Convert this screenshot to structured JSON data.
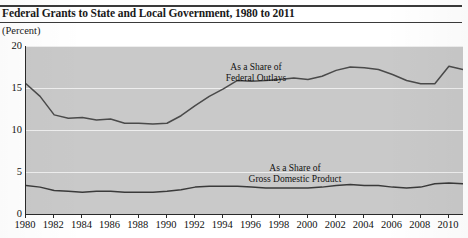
{
  "chart_data": {
    "type": "line",
    "title": "Federal Grants to State and Local Government, 1980 to 2011",
    "subtitle": "",
    "unit_label": "(Percent)",
    "xlabel": "",
    "ylabel": "",
    "grid": true,
    "legend_position": "inline-annotation",
    "xlim": [
      1980,
      2011
    ],
    "ylim": [
      0,
      20
    ],
    "yticks": [
      0,
      5,
      10,
      15,
      20
    ],
    "ytick_labels": [
      "0",
      "5",
      "10",
      "15",
      "20"
    ],
    "xticks": [
      1980,
      1982,
      1984,
      1986,
      1988,
      1990,
      1992,
      1994,
      1996,
      1998,
      2000,
      2002,
      2004,
      2006,
      2008,
      2010
    ],
    "xtick_labels": [
      "1980",
      "1982",
      "1984",
      "1986",
      "1988",
      "1990",
      "1992",
      "1994",
      "1996",
      "1998",
      "2000",
      "2002",
      "2004",
      "2006",
      "2008",
      "2010"
    ],
    "x": [
      1980,
      1981,
      1982,
      1983,
      1984,
      1985,
      1986,
      1987,
      1988,
      1989,
      1990,
      1991,
      1992,
      1993,
      1994,
      1995,
      1996,
      1997,
      1998,
      1999,
      2000,
      2001,
      2002,
      2003,
      2004,
      2005,
      2006,
      2007,
      2008,
      2009,
      2010,
      2011
    ],
    "series": [
      {
        "name": "As a Share of Federal Outlays",
        "annotation_line1": "As a Share of",
        "annotation_line2": "Federal Outlays",
        "color": "#4a4a4a",
        "values": [
          15.5,
          14.0,
          11.8,
          11.4,
          11.5,
          11.2,
          11.3,
          10.8,
          10.8,
          10.7,
          10.8,
          11.7,
          12.9,
          14.0,
          14.9,
          15.9,
          15.8,
          15.9,
          16.0,
          16.2,
          16.0,
          16.4,
          17.1,
          17.5,
          17.4,
          17.2,
          16.6,
          15.9,
          15.5,
          15.5,
          17.6,
          17.2
        ]
      },
      {
        "name": "As a Share of Gross Domestic Product",
        "annotation_line1": "As a Share of",
        "annotation_line2": "Gross Domestic Product",
        "color": "#3a3a3a",
        "values": [
          3.4,
          3.2,
          2.8,
          2.7,
          2.6,
          2.7,
          2.7,
          2.6,
          2.6,
          2.6,
          2.7,
          2.9,
          3.2,
          3.3,
          3.3,
          3.3,
          3.2,
          3.1,
          3.1,
          3.1,
          3.1,
          3.2,
          3.4,
          3.5,
          3.4,
          3.4,
          3.2,
          3.1,
          3.2,
          3.6,
          3.7,
          3.6
        ]
      }
    ]
  }
}
